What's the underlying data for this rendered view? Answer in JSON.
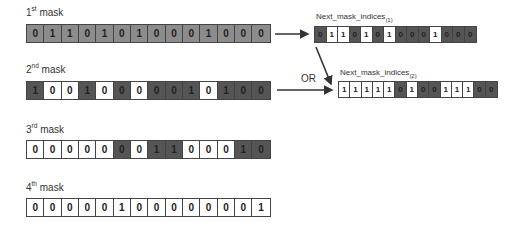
{
  "masks": [
    {
      "ordinal": "1",
      "suffix": "st",
      "word": "mask",
      "values": [
        "0",
        "1",
        "1",
        "0",
        "1",
        "0",
        "1",
        "0",
        "0",
        "0",
        "1",
        "0",
        "0",
        "0"
      ],
      "shading": [
        "gray",
        "gray",
        "gray",
        "gray",
        "gray",
        "gray",
        "gray",
        "gray",
        "gray",
        "gray",
        "gray",
        "gray",
        "gray",
        "gray"
      ]
    },
    {
      "ordinal": "2",
      "suffix": "nd",
      "word": "mask",
      "values": [
        "1",
        "0",
        "0",
        "1",
        "0",
        "0",
        "0",
        "0",
        "0",
        "1",
        "0",
        "1",
        "0",
        "0"
      ],
      "shading": [
        "dark",
        "white",
        "white",
        "dark",
        "white",
        "dark",
        "white",
        "dark",
        "dark",
        "dark",
        "white",
        "dark",
        "dark",
        "dark"
      ]
    },
    {
      "ordinal": "3",
      "suffix": "rd",
      "word": "mask",
      "values": [
        "0",
        "0",
        "0",
        "0",
        "0",
        "0",
        "0",
        "1",
        "1",
        "0",
        "0",
        "0",
        "1",
        "0"
      ],
      "shading": [
        "white",
        "white",
        "white",
        "white",
        "white",
        "dark",
        "white",
        "dark",
        "dark",
        "white",
        "white",
        "white",
        "dark",
        "dark"
      ]
    },
    {
      "ordinal": "4",
      "suffix": "th",
      "word": "mask",
      "values": [
        "0",
        "0",
        "0",
        "0",
        "0",
        "1",
        "0",
        "0",
        "0",
        "0",
        "0",
        "0",
        "0",
        "1"
      ],
      "shading": [
        "white",
        "white",
        "white",
        "white",
        "white",
        "white",
        "white",
        "white",
        "white",
        "white",
        "white",
        "white",
        "white",
        "white"
      ]
    }
  ],
  "next_indices": [
    {
      "name": "Next_mask_indices",
      "subscript": "(1)",
      "values": [
        "0",
        "1",
        "1",
        "0",
        "1",
        "0",
        "1",
        "0",
        "0",
        "0",
        "1",
        "0",
        "0",
        "0"
      ],
      "shading": [
        "dark",
        "white",
        "white",
        "dark",
        "white",
        "dark",
        "white",
        "dark",
        "dark",
        "dark",
        "white",
        "dark",
        "dark",
        "dark"
      ]
    },
    {
      "name": "Next_mask_indices",
      "subscript": "(2)",
      "values": [
        "1",
        "1",
        "1",
        "1",
        "1",
        "0",
        "1",
        "0",
        "0",
        "1",
        "1",
        "1",
        "0",
        "0"
      ],
      "shading": [
        "white",
        "white",
        "white",
        "white",
        "white",
        "dark",
        "white",
        "dark",
        "dark",
        "white",
        "white",
        "white",
        "dark",
        "dark"
      ]
    }
  ],
  "operator_label": "OR",
  "colors": {
    "gray": "#8c8c8c",
    "dark": "#555555",
    "white": "#ffffff",
    "border": "#444444"
  }
}
